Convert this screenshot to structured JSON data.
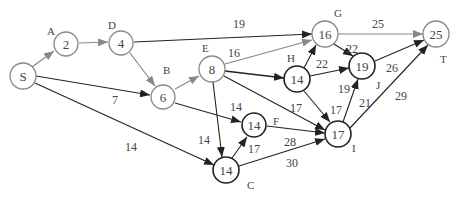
{
  "diagram": {
    "type": "directed-weighted-graph",
    "nodes": [
      {
        "id": "S",
        "value": "S",
        "letter": "",
        "x": 23,
        "y": 76,
        "dark": false
      },
      {
        "id": "A",
        "value": "2",
        "letter": "A",
        "x": 66,
        "y": 44,
        "dark": false
      },
      {
        "id": "D",
        "value": "4",
        "letter": "D",
        "x": 121,
        "y": 43,
        "dark": false
      },
      {
        "id": "B",
        "value": "6",
        "letter": "B",
        "x": 163,
        "y": 97,
        "dark": false
      },
      {
        "id": "E",
        "value": "8",
        "letter": "E",
        "x": 212,
        "y": 69,
        "dark": false
      },
      {
        "id": "G",
        "value": "16",
        "letter": "G",
        "x": 325,
        "y": 34,
        "dark": false
      },
      {
        "id": "H",
        "value": "14",
        "letter": "H",
        "x": 297,
        "y": 79,
        "dark": true
      },
      {
        "id": "J",
        "value": "19",
        "letter": "J",
        "x": 362,
        "y": 66,
        "dark": true
      },
      {
        "id": "T",
        "value": "25",
        "letter": "T",
        "x": 436,
        "y": 34,
        "dark": false
      },
      {
        "id": "F",
        "value": "14",
        "letter": "F",
        "x": 254,
        "y": 125,
        "dark": true
      },
      {
        "id": "I",
        "value": "17",
        "letter": "I",
        "x": 338,
        "y": 134,
        "dark": true
      },
      {
        "id": "C",
        "value": "14",
        "letter": "C",
        "x": 226,
        "y": 170,
        "dark": true
      }
    ],
    "edges": [
      {
        "from": "S",
        "to": "A",
        "weight": ""
      },
      {
        "from": "A",
        "to": "D",
        "weight": ""
      },
      {
        "from": "D",
        "to": "G",
        "weight": "19"
      },
      {
        "from": "D",
        "to": "B",
        "weight": ""
      },
      {
        "from": "S",
        "to": "B",
        "weight": "7"
      },
      {
        "from": "S",
        "to": "C",
        "weight": "14"
      },
      {
        "from": "B",
        "to": "E",
        "weight": ""
      },
      {
        "from": "B",
        "to": "F",
        "weight": "14"
      },
      {
        "from": "E",
        "to": "G",
        "weight": "16"
      },
      {
        "from": "E",
        "to": "H",
        "weight": ""
      },
      {
        "from": "E",
        "to": "I",
        "weight": "17"
      },
      {
        "from": "E",
        "to": "C",
        "weight": "14"
      },
      {
        "from": "H",
        "to": "G",
        "weight": "22"
      },
      {
        "from": "H",
        "to": "J",
        "weight": "19"
      },
      {
        "from": "H",
        "to": "I",
        "weight": "17"
      },
      {
        "from": "G",
        "to": "J",
        "weight": "22"
      },
      {
        "from": "G",
        "to": "T",
        "weight": "25"
      },
      {
        "from": "J",
        "to": "T",
        "weight": "26"
      },
      {
        "from": "I",
        "to": "J",
        "weight": "21"
      },
      {
        "from": "I",
        "to": "T",
        "weight": "29"
      },
      {
        "from": "F",
        "to": "I",
        "weight": "28"
      },
      {
        "from": "C",
        "to": "F",
        "weight": "17"
      },
      {
        "from": "C",
        "to": "I",
        "weight": "30"
      }
    ]
  },
  "labels": {
    "nodes": {
      "S": "S",
      "A": "2",
      "D": "4",
      "B": "6",
      "E": "8",
      "G": "16",
      "H": "14",
      "J": "19",
      "T": "25",
      "F": "14",
      "I": "17",
      "C": "14"
    },
    "letters": {
      "A": "A",
      "D": "D",
      "B": "B",
      "E": "E",
      "G": "G",
      "H": "H",
      "J": "J",
      "T": "T",
      "F": "F",
      "I": "I",
      "C": "C"
    },
    "weights": {
      "D_G": "19",
      "S_B": "7",
      "S_C": "14",
      "B_F": "14",
      "E_G": "16",
      "E_I": "17",
      "E_C": "14",
      "H_G": "22",
      "H_J": "19",
      "H_I": "17",
      "G_J": "22",
      "G_T": "25",
      "J_T": "26",
      "I_J": "21",
      "I_T": "29",
      "F_I": "28",
      "C_F": "17",
      "C_I": "30"
    }
  }
}
